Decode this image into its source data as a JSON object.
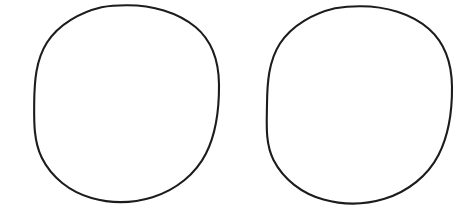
{
  "canvas": {
    "width": 474,
    "height": 220,
    "background_color": "#ffffff",
    "description": "Two hand-drawn circle outlines side by side on a plain white background"
  },
  "ink": {
    "color": "#1c1c1c",
    "stroke_width": 2.1,
    "style": "hand-drawn-pen"
  },
  "shapes": [
    {
      "name": "left-circle",
      "label": "Left circle",
      "center_x": 126.5,
      "center_y": 103.5,
      "radius_x": 92.5,
      "radius_y": 98.5,
      "bounds": {
        "left": 34,
        "top": 5,
        "right": 219,
        "bottom": 202
      },
      "stroke_color": "#1c1c1c",
      "stroke_width": 2.1,
      "fill": "none",
      "path": "M 126.5 5.2 C 152.0 5.0 177.5 12.2 195.5 27.0 C 211.8 40.6 218.8 61.5 219.0 84.5 C 219.2 108.0 216.6 132.5 206.0 153.5 C 195.8 173.8 176.0 190.0 152.5 197.2 C 133.0 203.2 111.0 203.6 91.5 198.0 C 70.0 191.8 51.5 177.5 41.8 157.8 C 33.6 141.2 34.0 121.5 34.2 103.0 C 34.4 82.0 35.8 60.0 47.0 42.5 C 58.8 24.0 80.5 12.2 101.5 7.2 C 109.8 5.6 118.2 5.2 126.5 5.2 Z"
    },
    {
      "name": "right-circle",
      "label": "Right circle",
      "center_x": 359.5,
      "center_y": 105.0,
      "radius_x": 92.5,
      "radius_y": 99.0,
      "bounds": {
        "left": 267,
        "top": 6,
        "right": 452,
        "bottom": 204
      },
      "stroke_color": "#1c1c1c",
      "stroke_width": 2.1,
      "fill": "none",
      "path": "M 359.5 6.2 C 385.5 6.0 411.5 13.5 429.0 29.0 C 445.0 43.2 451.8 64.5 452.0 87.0 C 452.2 110.5 449.0 134.5 438.5 155.0 C 428.0 175.5 408.0 191.5 384.5 198.8 C 365.0 204.8 343.0 205.0 323.5 199.5 C 302.0 193.5 283.5 179.5 273.5 160.0 C 265.0 143.2 266.8 123.0 267.0 104.5 C 267.2 83.5 268.5 61.2 280.0 43.5 C 292.0 25.0 313.8 13.2 335.0 8.2 C 343.2 6.8 351.4 6.2 359.5 6.2 Z"
    }
  ]
}
